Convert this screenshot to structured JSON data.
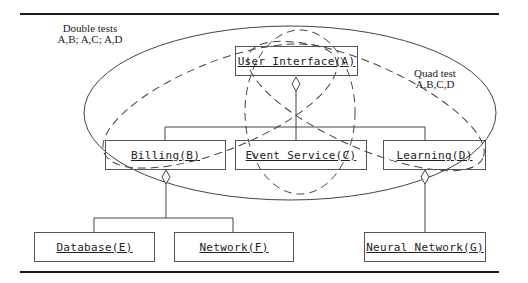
{
  "diagram": {
    "annotations": {
      "double_tests": {
        "title": "Double tests",
        "pairs": "A,B; A,C; A,D"
      },
      "quad_test": {
        "title": "Quad test",
        "set": "A,B,C,D"
      }
    },
    "components": [
      {
        "id": "A",
        "label": "User Interface(A)"
      },
      {
        "id": "B",
        "label": "Billing(B)"
      },
      {
        "id": "C",
        "label": "Event Service(C)"
      },
      {
        "id": "D",
        "label": "Learning(D)"
      },
      {
        "id": "E",
        "label": "Database(E)"
      },
      {
        "id": "F",
        "label": "Network(F)"
      },
      {
        "id": "G",
        "label": "Neural Network(G)"
      }
    ],
    "relations": [
      {
        "from": "A",
        "to": [
          "B",
          "C",
          "D"
        ],
        "type": "aggregation"
      },
      {
        "from": "B",
        "to": [
          "E",
          "F"
        ],
        "type": "aggregation"
      },
      {
        "from": "D",
        "to": [
          "G"
        ],
        "type": "aggregation"
      }
    ],
    "groupings": [
      {
        "style": "solid-ellipse",
        "members": [
          "A",
          "B",
          "C",
          "D"
        ],
        "meaning": "Quad test"
      },
      {
        "style": "dashed-ellipse",
        "members": [
          "A",
          "B"
        ],
        "meaning": "Double test"
      },
      {
        "style": "dashed-ellipse",
        "members": [
          "A",
          "C"
        ],
        "meaning": "Double test"
      },
      {
        "style": "dashed-ellipse",
        "members": [
          "A",
          "D"
        ],
        "meaning": "Double test"
      }
    ],
    "colors": {
      "line": "#444444",
      "rule": "#1a1a1a",
      "text": "#222222",
      "background": "#ffffff"
    }
  }
}
